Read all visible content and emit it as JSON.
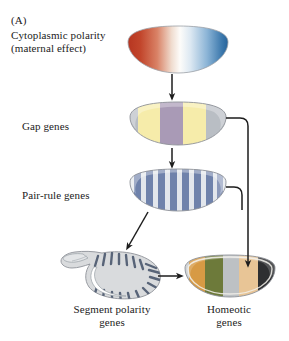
{
  "figure": {
    "panel_letter": "(A)",
    "background": "#ffffff"
  },
  "labels": {
    "cytoplasmic_line1": "Cytoplasmic polarity",
    "cytoplasmic_line2": "(maternal effect)",
    "gap_genes": "Gap genes",
    "pair_rule_genes": "Pair-rule genes",
    "segment_polarity_genes": "Segment polarity\ngenes",
    "segment_polarity_line1": "Segment polarity",
    "segment_polarity_line2": "genes",
    "homeotic_line1": "Homeotic",
    "homeotic_line2": "genes"
  },
  "stages": [
    {
      "id": "cytoplasmic-polarity",
      "label": "Cytoplasmic polarity (maternal effect)",
      "pattern": "gradient",
      "description": "Egg-shaped embryo with a red-to-white-to-blue anterior-posterior gradient",
      "colors": [
        "#c0392b",
        "#d9735f",
        "#f2efe9",
        "#ffffff",
        "#8fb4d4",
        "#2f6fa8"
      ]
    },
    {
      "id": "gap-genes",
      "label": "Gap genes",
      "pattern": "broad-bands",
      "description": "Embryo with broad gray / yellow / mauve / yellow / gray domains",
      "bands": [
        {
          "name": "anterior-gray",
          "color": "#b9bec4",
          "width_pct": 10
        },
        {
          "name": "anterior-yellow",
          "color": "#f4e9a0",
          "width_pct": 22
        },
        {
          "name": "central-mauve",
          "color": "#a99ab6",
          "width_pct": 22
        },
        {
          "name": "posterior-yellow",
          "color": "#f4e9a0",
          "width_pct": 24
        },
        {
          "name": "posterior-gray",
          "color": "#b9bec4",
          "width_pct": 22
        }
      ]
    },
    {
      "id": "pair-rule-genes",
      "label": "Pair-rule genes",
      "pattern": "stripes",
      "description": "Embryo with seven to eight periodic blue-gray transverse stripes",
      "stripe_count": 8,
      "stripe_color": "#6f82ab",
      "background_color": "#dfe3ea"
    },
    {
      "id": "segment-polarity-genes",
      "label": "Segment polarity genes",
      "pattern": "segmented-larva",
      "description": "Curled larva with repeating narrow dark-gray denticle bands",
      "stripe_count": 15,
      "stripe_color": "#5b6677",
      "body_color": "#d6d8da"
    },
    {
      "id": "homeotic-genes",
      "label": "Homeotic genes",
      "pattern": "identity-domains",
      "description": "Embryo with distinct segment-identity colour domains",
      "bands": [
        {
          "name": "band-orange",
          "color": "#d79a44",
          "width_pct": 17
        },
        {
          "name": "band-olive",
          "color": "#6d7a3a",
          "width_pct": 19
        },
        {
          "name": "band-gray",
          "color": "#bdc1c4",
          "width_pct": 17
        },
        {
          "name": "band-tan",
          "color": "#e8c596",
          "width_pct": 21
        },
        {
          "name": "band-dark",
          "color": "#2e2f31",
          "width_pct": 26
        }
      ]
    }
  ],
  "arrows": [
    {
      "id": "arrow-cyto-to-gap",
      "from": "cytoplasmic-polarity",
      "to": "gap-genes",
      "type": "vertical"
    },
    {
      "id": "arrow-gap-to-pair",
      "from": "gap-genes",
      "to": "pair-rule-genes",
      "type": "vertical"
    },
    {
      "id": "arrow-pair-to-segpol",
      "from": "pair-rule-genes",
      "to": "segment-polarity-genes",
      "type": "diagonal"
    },
    {
      "id": "arrow-gap-to-homeotic",
      "from": "gap-genes",
      "to": "homeotic-genes",
      "type": "elbow"
    },
    {
      "id": "arrow-pair-to-homeotic",
      "from": "pair-rule-genes",
      "to": "homeotic-genes",
      "type": "elbow"
    },
    {
      "id": "arrow-segpol-to-homeotic",
      "from": "segment-polarity-genes",
      "to": "homeotic-genes",
      "type": "horizontal"
    }
  ],
  "colors": {
    "stroke": "#1d1d1d",
    "outline": "#8e9298",
    "text": "#1b1b1b"
  }
}
